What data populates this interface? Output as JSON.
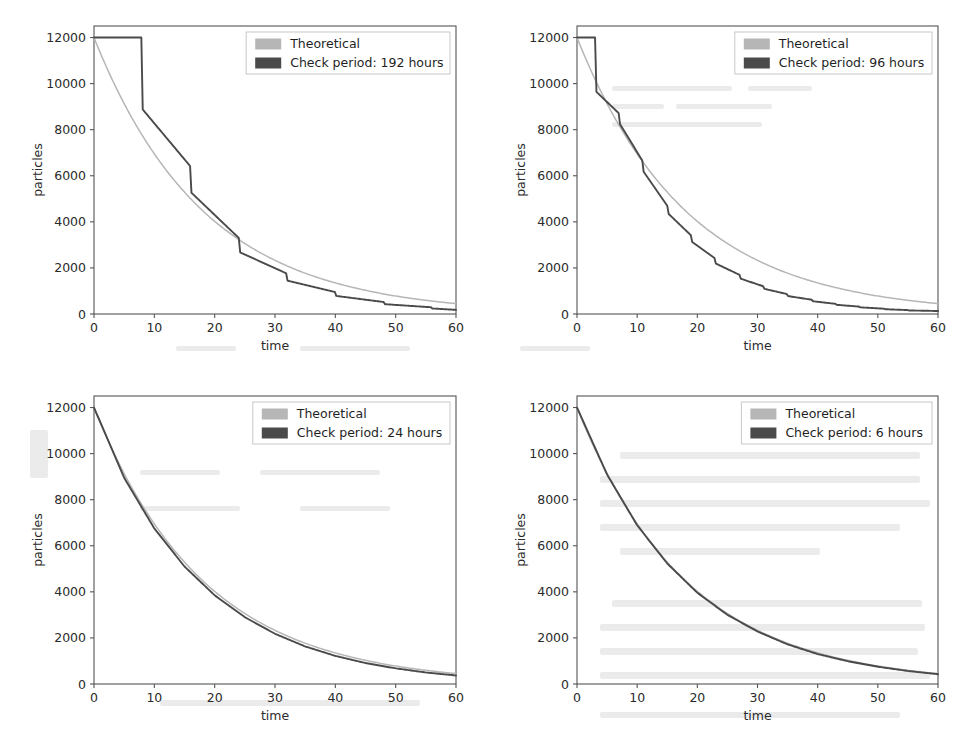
{
  "figure": {
    "layout": "2x2-grid",
    "background_color": "#ffffff",
    "colors": {
      "theoretical": "#b6b6b6",
      "simulated": "#4a4a4a",
      "axis": "#555555",
      "text": "#262626"
    }
  },
  "chart_data": [
    {
      "type": "line",
      "panel": "top-left",
      "title": "",
      "xlabel": "time",
      "ylabel": "particles",
      "xlim": [
        0,
        60
      ],
      "ylim": [
        0,
        12500
      ],
      "xticks": [
        0,
        10,
        20,
        30,
        40,
        50,
        60
      ],
      "yticks": [
        0,
        2000,
        4000,
        6000,
        8000,
        10000,
        12000
      ],
      "grid": false,
      "legend_position": "upper right",
      "legend": [
        "Theoretical",
        "Check period: 192 hours"
      ],
      "check_period_hours": 192,
      "check_period_days": 8,
      "initial_particles": 12000,
      "half_life_days": 12.6,
      "series": [
        {
          "name": "Theoretical",
          "color": "#b6b6b6",
          "model": "exponential-decay",
          "x": [
            0,
            5,
            10,
            15,
            20,
            25,
            30,
            35,
            40,
            45,
            50,
            55,
            60
          ],
          "values": [
            12000,
            9130,
            6950,
            5290,
            4020,
            3060,
            2330,
            1770,
            1350,
            1030,
            780,
            595,
            450
          ]
        },
        {
          "name": "Check period: 192 hours",
          "color": "#4a4a4a",
          "model": "staircase-exponential-decay",
          "x": [
            0,
            8,
            8,
            16,
            16,
            24,
            24,
            32,
            32,
            40,
            40,
            48,
            48,
            56,
            56,
            60
          ],
          "values": [
            12000,
            12000,
            8900,
            6400,
            5300,
            3300,
            2700,
            1750,
            1450,
            950,
            790,
            520,
            430,
            290,
            240,
            180
          ]
        }
      ]
    },
    {
      "type": "line",
      "panel": "top-right",
      "title": "",
      "xlabel": "time",
      "ylabel": "particles",
      "xlim": [
        0,
        60
      ],
      "ylim": [
        0,
        12500
      ],
      "xticks": [
        0,
        10,
        20,
        30,
        40,
        50,
        60
      ],
      "yticks": [
        0,
        2000,
        4000,
        6000,
        8000,
        10000,
        12000
      ],
      "grid": false,
      "legend_position": "upper right",
      "legend": [
        "Theoretical",
        "Check period: 96 hours"
      ],
      "check_period_hours": 96,
      "check_period_days": 4,
      "initial_particles": 12000,
      "half_life_days": 12.6,
      "series": [
        {
          "name": "Theoretical",
          "color": "#b6b6b6",
          "model": "exponential-decay",
          "x": [
            0,
            5,
            10,
            15,
            20,
            25,
            30,
            35,
            40,
            45,
            50,
            55,
            60
          ],
          "values": [
            12000,
            9130,
            6950,
            5290,
            4020,
            3060,
            2330,
            1770,
            1350,
            1030,
            780,
            595,
            450
          ]
        },
        {
          "name": "Check period: 96 hours",
          "color": "#4a4a4a",
          "model": "staircase-exponential-decay",
          "x": [
            0,
            3,
            3,
            7,
            7,
            11,
            11,
            15,
            15,
            19,
            19,
            23,
            23,
            27,
            27,
            31,
            31,
            35,
            35,
            39,
            39,
            43,
            43,
            47,
            47,
            51,
            51,
            55,
            55,
            60
          ],
          "values": [
            12000,
            12000,
            9700,
            8700,
            8300,
            6600,
            6200,
            4700,
            4400,
            3400,
            3150,
            2400,
            2200,
            1700,
            1550,
            1200,
            1100,
            860,
            780,
            620,
            560,
            440,
            400,
            320,
            290,
            230,
            210,
            170,
            155,
            130
          ]
        }
      ]
    },
    {
      "type": "line",
      "panel": "bottom-left",
      "title": "",
      "xlabel": "time",
      "ylabel": "particles",
      "xlim": [
        0,
        60
      ],
      "ylim": [
        0,
        12500
      ],
      "xticks": [
        0,
        10,
        20,
        30,
        40,
        50,
        60
      ],
      "yticks": [
        0,
        2000,
        4000,
        6000,
        8000,
        10000,
        12000
      ],
      "grid": false,
      "legend_position": "upper right",
      "legend": [
        "Theoretical",
        "Check period: 24 hours"
      ],
      "check_period_hours": 24,
      "check_period_days": 1,
      "initial_particles": 12000,
      "half_life_days": 12.6,
      "series": [
        {
          "name": "Theoretical",
          "color": "#b6b6b6",
          "model": "exponential-decay",
          "x": [
            0,
            5,
            10,
            15,
            20,
            25,
            30,
            35,
            40,
            45,
            50,
            55,
            60
          ],
          "values": [
            12000,
            9130,
            6950,
            5290,
            4020,
            3060,
            2330,
            1770,
            1350,
            1030,
            780,
            595,
            450
          ]
        },
        {
          "name": "Check period: 24 hours",
          "color": "#4a4a4a",
          "model": "staircase-exponential-decay",
          "x": [
            0,
            5,
            10,
            15,
            20,
            25,
            30,
            35,
            40,
            45,
            50,
            55,
            60
          ],
          "values": [
            12000,
            8950,
            6750,
            5100,
            3850,
            2900,
            2180,
            1630,
            1220,
            910,
            680,
            500,
            370
          ]
        }
      ]
    },
    {
      "type": "line",
      "panel": "bottom-right",
      "title": "",
      "xlabel": "time",
      "ylabel": "particles",
      "xlim": [
        0,
        60
      ],
      "ylim": [
        0,
        12500
      ],
      "xticks": [
        0,
        10,
        20,
        30,
        40,
        50,
        60
      ],
      "yticks": [
        0,
        2000,
        4000,
        6000,
        8000,
        10000,
        12000
      ],
      "grid": false,
      "legend_position": "upper right",
      "legend": [
        "Theoretical",
        "Check period: 6 hours"
      ],
      "check_period_hours": 6,
      "check_period_days": 0.25,
      "initial_particles": 12000,
      "half_life_days": 12.6,
      "series": [
        {
          "name": "Theoretical",
          "color": "#b6b6b6",
          "model": "exponential-decay",
          "x": [
            0,
            5,
            10,
            15,
            20,
            25,
            30,
            35,
            40,
            45,
            50,
            55,
            60
          ],
          "values": [
            12000,
            9130,
            6950,
            5290,
            4020,
            3060,
            2330,
            1770,
            1350,
            1030,
            780,
            595,
            450
          ]
        },
        {
          "name": "Check period: 6 hours",
          "color": "#4a4a4a",
          "model": "staircase-exponential-decay",
          "x": [
            0,
            5,
            10,
            15,
            20,
            25,
            30,
            35,
            40,
            45,
            50,
            55,
            60
          ],
          "values": [
            12000,
            9090,
            6890,
            5230,
            3960,
            3000,
            2280,
            1720,
            1300,
            990,
            750,
            565,
            425
          ]
        }
      ]
    }
  ]
}
